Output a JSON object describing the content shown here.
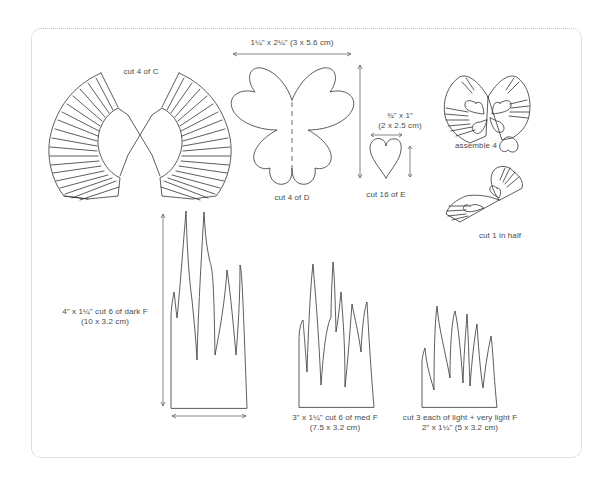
{
  "template": {
    "pieces": [
      {
        "id": "C",
        "label": "cut 4 of C"
      },
      {
        "id": "D",
        "label": "cut 4 of D",
        "dimension": "1¼\" x 2¼\" (3 x 5.6 cm)"
      },
      {
        "id": "E",
        "label": "cut 16 of E",
        "dimension_line1": "¾\" x 1\"",
        "dimension_line2": "(2 x 2.5 cm)"
      },
      {
        "id": "F-dark",
        "label_line1": "4\" x 1¼\" cut 6 of dark F",
        "label_line2": "(10 x 3.2 cm)"
      },
      {
        "id": "F-med",
        "label_line1": "3\" x 1¼\" cut 6 of med F",
        "label_line2": "(7.5 x 3.2 cm)"
      },
      {
        "id": "F-light",
        "label_line1": "cut 3 each of light + very light F",
        "label_line2": "2\" x 1¼\" (5 x 3.2 cm)"
      }
    ],
    "assembly": [
      {
        "label": "assemble 4"
      },
      {
        "label": "cut 1 in half"
      }
    ]
  },
  "colors": {
    "line": "#333333",
    "text": "#4a4a4a",
    "frame": "#bdbdbd",
    "background": "#ffffff"
  }
}
